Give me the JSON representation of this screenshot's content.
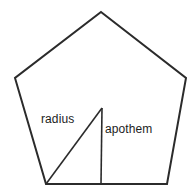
{
  "figure": {
    "background_color": "#ffffff",
    "stroke_color": "#2b2b2b",
    "text_color": "#1d1d1d",
    "shape": {
      "name": "regular-pentagon",
      "sides": 5,
      "vertices": [
        {
          "name": "apex",
          "x": 101,
          "y": 12
        },
        {
          "name": "right-upper",
          "x": 186,
          "y": 78
        },
        {
          "name": "right-lower",
          "x": 167,
          "y": 184
        },
        {
          "name": "left-lower",
          "x": 46,
          "y": 184
        },
        {
          "name": "left-upper",
          "x": 15,
          "y": 78
        }
      ],
      "path": "M101,12 L186,78 L167,184 L46,184 L15,78 Z"
    },
    "center": {
      "x": 102,
      "y": 108
    },
    "segments": [
      {
        "name": "radius",
        "label": "radius",
        "from": {
          "x": 102,
          "y": 108
        },
        "to": {
          "x": 46,
          "y": 184
        },
        "path": "M102,108 L46,184"
      },
      {
        "name": "apothem",
        "label": "apothem",
        "from": {
          "x": 102,
          "y": 108
        },
        "to": {
          "x": 101,
          "y": 184
        },
        "path": "M102,108 L101,184"
      }
    ],
    "labels": {
      "radius": "radius",
      "apothem": "apothem"
    }
  }
}
